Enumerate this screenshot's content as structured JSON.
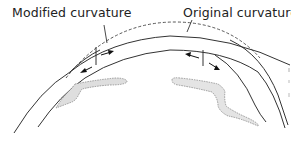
{
  "labels": {
    "modified": "Modified curvature",
    "original": "Original curvature"
  },
  "colors": {
    "line": "#333333",
    "dashed": "#444444",
    "shade": "#d9d9d9",
    "background": "#ffffff"
  },
  "diagram": {
    "elements": [
      "outer-cornea-curve",
      "inner-cornea-curve",
      "original-curvature-dashed",
      "left-ring-segment",
      "right-ring-segment",
      "left-iris-shading",
      "right-iris-shading"
    ]
  }
}
